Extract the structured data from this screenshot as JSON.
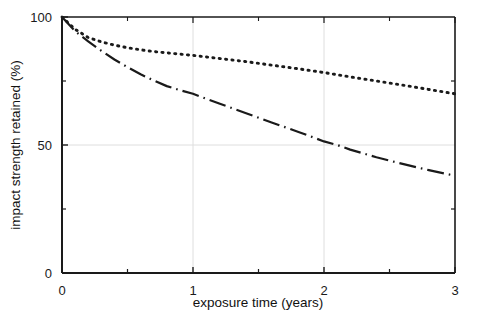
{
  "chart_data": {
    "type": "line",
    "title": "",
    "subtitle": "",
    "xlabel": "exposure time (years)",
    "ylabel": "impact strength retained (%)",
    "xlim": [
      0,
      3
    ],
    "ylim": [
      0,
      100
    ],
    "xticks": [
      0,
      1,
      2,
      3
    ],
    "xtick_labels": [
      "0",
      "1",
      "2",
      "3"
    ],
    "xminor_ticks": [
      0.5,
      1.5,
      2.5
    ],
    "yticks": [
      0,
      50,
      100
    ],
    "ytick_labels": [
      "0",
      "50",
      "100"
    ],
    "yminor_ticks": [
      25,
      75
    ],
    "grid": {
      "enabled": true,
      "x_gridlines": [
        1,
        2
      ],
      "y_gridlines": [
        50
      ],
      "color": "#dedede"
    },
    "legend": {
      "visible": false,
      "position": "none"
    },
    "annotations": [],
    "series": [
      {
        "name": "dotted-curve",
        "linestyle": "dotted",
        "color": "#1a1a1a",
        "x": [
          0.0,
          0.1,
          0.2,
          0.3,
          0.4,
          0.5,
          0.6,
          0.7,
          0.8,
          0.9,
          1.0,
          1.2,
          1.4,
          1.6,
          1.8,
          2.0,
          2.2,
          2.4,
          2.6,
          2.8,
          3.0
        ],
        "values": [
          100.0,
          95.2,
          92.0,
          90.3,
          89.0,
          88.0,
          87.2,
          86.5,
          86.0,
          85.5,
          85.0,
          83.8,
          82.6,
          81.2,
          79.8,
          78.3,
          76.6,
          75.0,
          73.4,
          71.7,
          70.0
        ]
      },
      {
        "name": "dash-dot-curve",
        "linestyle": "dashdot",
        "color": "#1a1a1a",
        "x": [
          0.0,
          0.1,
          0.2,
          0.3,
          0.4,
          0.5,
          0.6,
          0.7,
          0.8,
          0.9,
          1.0,
          1.2,
          1.4,
          1.6,
          1.8,
          2.0,
          2.1,
          2.2,
          2.4,
          2.6,
          2.8,
          3.0
        ],
        "values": [
          100.0,
          94.5,
          90.5,
          86.8,
          83.4,
          80.4,
          77.6,
          75.2,
          73.0,
          71.4,
          70.0,
          66.2,
          62.5,
          58.8,
          55.2,
          51.4,
          50.0,
          48.2,
          45.2,
          42.6,
          40.2,
          38.0
        ]
      }
    ]
  }
}
